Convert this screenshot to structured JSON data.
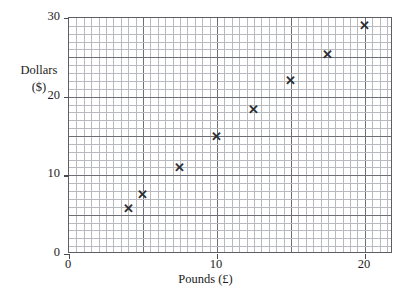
{
  "figure": {
    "cropped_header_fragment": "                  ",
    "background_color": "#ffffff",
    "frame_color": "#5d5d62",
    "grid_minor_color": "#b9b9c0",
    "grid_major_color": "#6e6e75",
    "marker_color": "#2e2e33",
    "marker_glyph": "✕"
  },
  "axes": {
    "x": {
      "label": "Pounds (£)",
      "ticks": [
        "0",
        "10",
        "20"
      ],
      "tick_values": [
        0,
        10,
        20
      ],
      "min": 0,
      "max": 21.9,
      "minor_step": 0.5,
      "major_step": 5
    },
    "y": {
      "label_line1": "Dollars",
      "label_line2": "($)",
      "ticks": [
        "0",
        "10",
        "20",
        "30"
      ],
      "tick_values": [
        0,
        10,
        20,
        30
      ],
      "min": 0,
      "max": 30,
      "minor_step": 1,
      "major_step": 5
    }
  },
  "chart_data": {
    "type": "scatter",
    "title": "",
    "xlabel": "Pounds (£)",
    "ylabel": "Dollars ($)",
    "xlim": [
      0,
      21.9
    ],
    "ylim": [
      0,
      30
    ],
    "grid": true,
    "legend": null,
    "x": [
      4,
      5,
      7.5,
      10,
      12.5,
      15,
      17.5,
      20
    ],
    "y": [
      5.8,
      7.6,
      11,
      15,
      18.4,
      22,
      25.4,
      29
    ],
    "points": [
      {
        "x": 4,
        "y": 5.8
      },
      {
        "x": 5,
        "y": 7.6
      },
      {
        "x": 7.5,
        "y": 11
      },
      {
        "x": 10,
        "y": 15
      },
      {
        "x": 12.5,
        "y": 18.4
      },
      {
        "x": 15,
        "y": 22
      },
      {
        "x": 17.5,
        "y": 25.4
      },
      {
        "x": 20,
        "y": 29
      }
    ]
  }
}
